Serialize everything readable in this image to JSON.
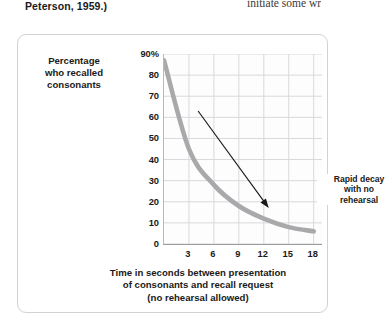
{
  "page": {
    "caption_tail": "Peterson, 1959.)",
    "body_fragment": "initiate some wr"
  },
  "figure": {
    "y_axis_title_lines": [
      "Percentage",
      "who recalled",
      "consonants"
    ],
    "x_axis_title_lines": [
      "Time in seconds between presentation",
      "of consonants and recall request",
      "(no rehearsal allowed)"
    ],
    "annotation_lines": [
      "Rapid decay",
      "with no",
      "rehearsal"
    ],
    "colors": {
      "curve": "#a9a9ac",
      "grid": "#d9d9dd",
      "axis": "#9b9b9f",
      "arrow": "#1a1a1a",
      "box_border": "#d2d2d2"
    }
  },
  "chart_data": {
    "type": "line",
    "title": "",
    "xlabel": "Time in seconds between presentation of consonants and recall request (no rehearsal allowed)",
    "ylabel": "Percentage who recalled consonants",
    "xlim": [
      0,
      19
    ],
    "ylim": [
      0,
      90
    ],
    "xticks": [
      3,
      6,
      9,
      12,
      15,
      18
    ],
    "xtick_labels": [
      "3",
      "6",
      "9",
      "12",
      "15",
      "18"
    ],
    "yticks": [
      0,
      10,
      20,
      30,
      40,
      50,
      60,
      70,
      80,
      90
    ],
    "ytick_labels": [
      "0",
      "10",
      "20",
      "30",
      "40",
      "50",
      "60",
      "70",
      "80",
      "90%"
    ],
    "grid": true,
    "legend": "none",
    "series": [
      {
        "name": "Percentage recalled",
        "x": [
          0,
          3,
          6,
          9,
          12,
          15,
          18
        ],
        "values": [
          87,
          45,
          28,
          18,
          12,
          8,
          6
        ]
      }
    ],
    "annotations": [
      {
        "text": "Rapid decay with no rehearsal",
        "arrow_from_x": 4.1,
        "arrow_from_y": 63,
        "arrow_to_x": 12.6,
        "arrow_to_y": 17
      }
    ]
  }
}
